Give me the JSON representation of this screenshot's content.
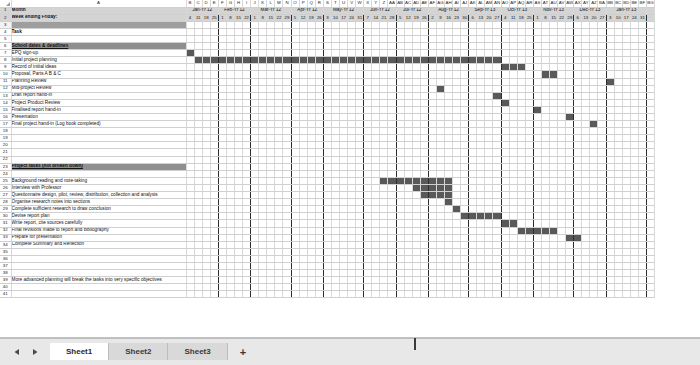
{
  "app": {
    "name": "spreadsheet-gantt",
    "accent_color": "#595959",
    "banner_color": "#8f8f8f",
    "shade_color": "#9e9e9e",
    "header_color": "#d4d4d4"
  },
  "columns": {
    "corner_label": "",
    "a_label": "A",
    "letters": [
      "B",
      "C",
      "D",
      "E",
      "F",
      "G",
      "H",
      "I",
      "J",
      "K",
      "L",
      "M",
      "N",
      "O",
      "P",
      "Q",
      "R",
      "S",
      "T",
      "U",
      "V",
      "W",
      "X",
      "Y",
      "Z",
      "AA",
      "AB",
      "AC",
      "AD",
      "AE",
      "AF",
      "AG",
      "AH",
      "AI",
      "AJ",
      "AK",
      "AL",
      "AM",
      "AN",
      "AO",
      "AP",
      "AQ",
      "AR",
      "AS",
      "AT",
      "AU",
      "AV",
      "AW",
      "AX",
      "AY",
      "AZ",
      "BA",
      "BB",
      "BC",
      "BD",
      "BE",
      "BF",
      "BG"
    ]
  },
  "header": {
    "row1_label": "Month",
    "row2_label": "Week ending Friday:",
    "months": [
      {
        "name": "Jan-Yr 12",
        "weeks": [
          "4",
          "11",
          "18",
          "25"
        ]
      },
      {
        "name": "Feb-Yr 12",
        "weeks": [
          "1",
          "8",
          "15",
          "22"
        ]
      },
      {
        "name": "Mar-Yr 12",
        "weeks": [
          "1",
          "8",
          "15",
          "22",
          "29"
        ]
      },
      {
        "name": "Apr-Yr 12",
        "weeks": [
          "5",
          "12",
          "19",
          "26"
        ]
      },
      {
        "name": "May-Yr 12",
        "weeks": [
          "3",
          "10",
          "17",
          "24",
          "31"
        ]
      },
      {
        "name": "Jun-Yr 12",
        "weeks": [
          "7",
          "14",
          "21",
          "28"
        ]
      },
      {
        "name": "Jul-Yr 12",
        "weeks": [
          "5",
          "12",
          "19",
          "26"
        ]
      },
      {
        "name": "Aug-Yr 12",
        "weeks": [
          "2",
          "9",
          "16",
          "23",
          "30"
        ]
      },
      {
        "name": "Sep-Yr 13",
        "weeks": [
          "6",
          "13",
          "20",
          "27"
        ]
      },
      {
        "name": "Oct-Yr 13",
        "weeks": [
          "4",
          "11",
          "18",
          "25"
        ]
      },
      {
        "name": "Nov-Yr 13",
        "weeks": [
          "1",
          "8",
          "15",
          "22",
          "29"
        ]
      },
      {
        "name": "Dec-Yr 13",
        "weeks": [
          "6",
          "13",
          "20",
          "27"
        ]
      },
      {
        "name": "Jan-Yr 13",
        "weeks": [
          "3",
          "10",
          "17",
          "24",
          "31"
        ]
      }
    ]
  },
  "rows": [
    {
      "n": 1,
      "label": "Month",
      "style": "header",
      "bars": []
    },
    {
      "n": 2,
      "label": "Week ending Friday:",
      "style": "header",
      "bars": []
    },
    {
      "n": 3,
      "label": "",
      "style": "shade",
      "bars": []
    },
    {
      "n": 4,
      "label": "Task",
      "style": "bold",
      "bars": []
    },
    {
      "n": 5,
      "label": "",
      "style": "normal",
      "bars": []
    },
    {
      "n": 6,
      "label": "School dates & deadlines",
      "style": "banner",
      "bars": []
    },
    {
      "n": 7,
      "label": "EPQ sign-up",
      "style": "normal",
      "bars": [
        [
          0,
          0
        ]
      ]
    },
    {
      "n": 8,
      "label": "Initial project planning",
      "style": "normal",
      "bars": [
        [
          1,
          38
        ]
      ]
    },
    {
      "n": 9,
      "label": "Record of initial ideas",
      "style": "normal",
      "bars": [
        [
          39,
          41
        ]
      ]
    },
    {
      "n": 10,
      "label": "Proposal, Parts A B & C",
      "style": "normal",
      "bars": [
        [
          44,
          45
        ]
      ]
    },
    {
      "n": 11,
      "label": "Planning Review",
      "style": "normal",
      "bars": [
        [
          52,
          52
        ]
      ]
    },
    {
      "n": 12,
      "label": "Mid-project Review",
      "style": "normal",
      "bars": []
    },
    {
      "n": 13,
      "label": "Draft report hand-in",
      "style": "normal",
      "bars": []
    },
    {
      "n": 14,
      "label": "Project Product Review",
      "style": "normal",
      "bars": []
    },
    {
      "n": 15,
      "label": "Finalised report hand-in",
      "style": "normal",
      "bars": []
    },
    {
      "n": 16,
      "label": "Presentation",
      "style": "normal",
      "bars": []
    },
    {
      "n": 17,
      "label": "Final project hand-in (Log book completed)",
      "style": "normal",
      "bars": []
    },
    {
      "n": 18,
      "label": "",
      "style": "normal",
      "bars": []
    },
    {
      "n": 19,
      "label": "",
      "style": "normal",
      "bars": []
    },
    {
      "n": 20,
      "label": "",
      "style": "normal",
      "bars": []
    },
    {
      "n": 21,
      "label": "",
      "style": "normal",
      "bars": []
    },
    {
      "n": 22,
      "label": "",
      "style": "normal",
      "bars": []
    },
    {
      "n": 23,
      "label": "Project tasks (not broken down)",
      "style": "banner",
      "bars": []
    },
    {
      "n": 24,
      "label": "",
      "style": "normal",
      "bars": []
    },
    {
      "n": 25,
      "label": "Background reading and note-taking",
      "style": "normal",
      "bars": [
        [
          24,
          32
        ]
      ]
    },
    {
      "n": 26,
      "label": "Interview with Professor",
      "style": "normal",
      "bars": [
        [
          28,
          32
        ]
      ]
    },
    {
      "n": 27,
      "label": "Questionnaire design, pilot, review, distribution, collection and analysis",
      "style": "normal",
      "bars": [
        [
          29,
          32
        ]
      ]
    },
    {
      "n": 28,
      "label": "Organise research notes into sections",
      "style": "normal",
      "bars": [
        [
          32,
          32
        ]
      ]
    },
    {
      "n": 29,
      "label": "Complete sufficient research to draw conclusion",
      "style": "normal",
      "bars": [
        [
          33,
          33
        ]
      ]
    },
    {
      "n": 30,
      "label": "Devise report plan",
      "style": "normal",
      "bars": [
        [
          34,
          38
        ]
      ]
    },
    {
      "n": 31,
      "label": "Write report, cite sources carefully",
      "style": "normal",
      "bars": [
        [
          39,
          40
        ]
      ]
    },
    {
      "n": 32,
      "label": "Final revisions made to report and bibliography",
      "style": "normal",
      "bars": [
        [
          41,
          45
        ]
      ]
    },
    {
      "n": 33,
      "label": "Prepare for presentation",
      "style": "normal",
      "bars": [
        [
          47,
          48
        ]
      ]
    },
    {
      "n": 34,
      "label": "Complete Summary and Reflection",
      "style": "normal",
      "bars": []
    },
    {
      "n": 35,
      "label": "",
      "style": "normal",
      "bars": []
    },
    {
      "n": 36,
      "label": "",
      "style": "normal",
      "bars": []
    },
    {
      "n": 37,
      "label": "",
      "style": "normal",
      "bars": []
    },
    {
      "n": 38,
      "label": "",
      "style": "normal",
      "bars": []
    },
    {
      "n": 39,
      "label": "More advanced planning will break the tasks into very specific objectives",
      "style": "normal",
      "bars": []
    },
    {
      "n": 40,
      "label": "",
      "style": "normal",
      "bars": []
    },
    {
      "n": 41,
      "label": "",
      "style": "normal",
      "bars": []
    }
  ],
  "milestones": [
    {
      "row": 12,
      "col": 31
    },
    {
      "row": 13,
      "col": 38
    },
    {
      "row": 14,
      "col": 39
    },
    {
      "row": 15,
      "col": 43
    },
    {
      "row": 16,
      "col": 47
    },
    {
      "row": 17,
      "col": 50
    }
  ],
  "tabs": {
    "prev_label": "◀",
    "next_label": "▶",
    "sheets": [
      {
        "label": "Sheet1",
        "active": true
      },
      {
        "label": "Sheet2",
        "active": false
      },
      {
        "label": "Sheet3",
        "active": false
      }
    ],
    "add_label": "+"
  }
}
